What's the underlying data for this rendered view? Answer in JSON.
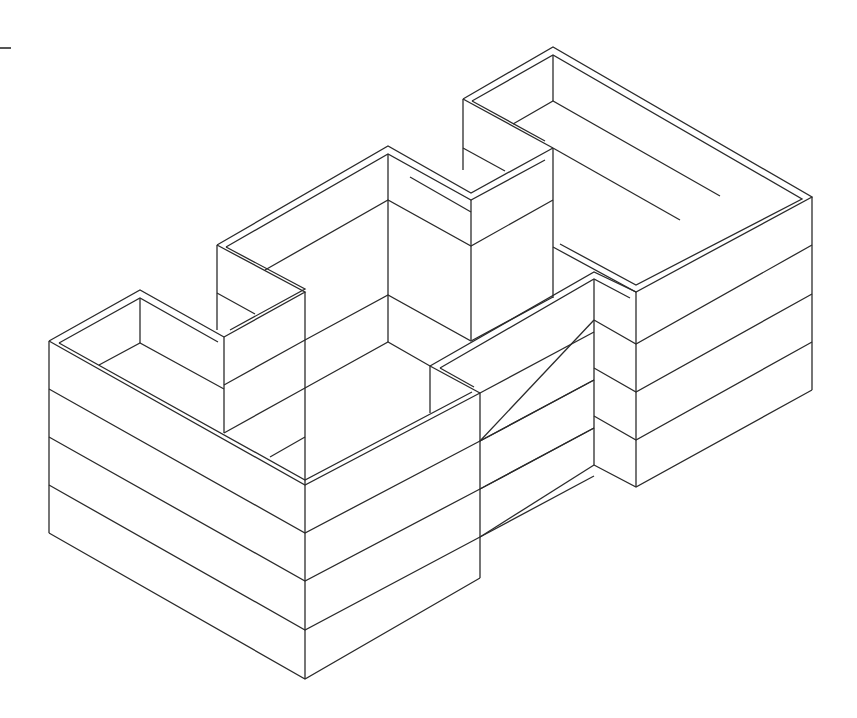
{
  "drawing": {
    "title": "",
    "stroke_color": "#2a2a2a",
    "stroke_width": 1.3,
    "background": "#ffffff",
    "marker": {
      "x1": 0,
      "y1": 48,
      "x2": 11,
      "y2": 48
    },
    "polylines": [
      {
        "part": "left-wing-rim-outer",
        "points": [
          [
            49,
            341
          ],
          [
            140,
            290
          ],
          [
            224,
            337
          ]
        ]
      },
      {
        "part": "left-wing-rim-inner",
        "points": [
          [
            59,
            343
          ],
          [
            140,
            298
          ],
          [
            218,
            342
          ]
        ]
      },
      {
        "part": "left-wing-front-rim-outer",
        "points": [
          [
            49,
            341
          ],
          [
            305,
            485
          ],
          [
            480,
            393
          ]
        ]
      },
      {
        "part": "left-wing-front-rim-inner",
        "points": [
          [
            59,
            343
          ],
          [
            305,
            480
          ],
          [
            472,
            392
          ]
        ]
      },
      {
        "part": "left-wing-left-edge",
        "points": [
          [
            49,
            341
          ],
          [
            49,
            533
          ]
        ]
      },
      {
        "part": "left-wing-level-1",
        "points": [
          [
            49,
            389
          ],
          [
            305,
            533
          ],
          [
            480,
            441
          ]
        ]
      },
      {
        "part": "left-wing-level-2",
        "points": [
          [
            49,
            437
          ],
          [
            305,
            581
          ],
          [
            480,
            489
          ]
        ]
      },
      {
        "part": "left-wing-level-3",
        "points": [
          [
            49,
            485
          ],
          [
            305,
            630
          ],
          [
            480,
            537
          ]
        ]
      },
      {
        "part": "left-wing-bottom",
        "points": [
          [
            49,
            533
          ],
          [
            305,
            679
          ],
          [
            480,
            578
          ]
        ]
      },
      {
        "part": "left-wing-front-edge",
        "points": [
          [
            305,
            485
          ],
          [
            305,
            679
          ]
        ]
      },
      {
        "part": "left-wing-right-edge",
        "points": [
          [
            480,
            393
          ],
          [
            480,
            578
          ]
        ]
      },
      {
        "part": "left-wing-inner-vertical",
        "points": [
          [
            140,
            298
          ],
          [
            140,
            343
          ]
        ]
      },
      {
        "part": "left-wing-inner-floor-a",
        "points": [
          [
            99,
            365
          ],
          [
            140,
            343
          ],
          [
            224,
            389
          ]
        ]
      },
      {
        "part": "left-wing-inner-wall",
        "points": [
          [
            224,
            337
          ],
          [
            224,
            433
          ]
        ]
      },
      {
        "part": "left-wing-inner-level",
        "points": [
          [
            224,
            385
          ],
          [
            305,
            340
          ]
        ]
      },
      {
        "part": "left-wing-inner-level-2",
        "points": [
          [
            224,
            433
          ],
          [
            305,
            388
          ]
        ]
      },
      {
        "part": "left-wing-inner-floor-b",
        "points": [
          [
            270,
            457
          ],
          [
            305,
            437
          ]
        ]
      },
      {
        "part": "mid-rim-outer",
        "points": [
          [
            217,
            245
          ],
          [
            388,
            146
          ],
          [
            471,
            193
          ],
          [
            553,
            148
          ]
        ]
      },
      {
        "part": "mid-rim-inner",
        "points": [
          [
            226,
            247
          ],
          [
            388,
            154
          ],
          [
            471,
            200
          ],
          [
            545,
            160
          ]
        ]
      },
      {
        "part": "mid-left-rim-outer",
        "points": [
          [
            217,
            245
          ],
          [
            305,
            292
          ],
          [
            224,
            337
          ]
        ]
      },
      {
        "part": "mid-left-rim-inner",
        "points": [
          [
            226,
            247
          ],
          [
            305,
            289
          ],
          [
            230,
            330
          ]
        ]
      },
      {
        "part": "mid-left-edge",
        "points": [
          [
            217,
            245
          ],
          [
            217,
            330
          ]
        ]
      },
      {
        "part": "mid-left-level",
        "points": [
          [
            217,
            293
          ],
          [
            255,
            314
          ]
        ]
      },
      {
        "part": "mid-front-edge",
        "points": [
          [
            305,
            292
          ],
          [
            305,
            485
          ]
        ]
      },
      {
        "part": "mid-back-vertical",
        "points": [
          [
            388,
            154
          ],
          [
            388,
            342
          ]
        ]
      },
      {
        "part": "mid-level-1",
        "points": [
          [
            265,
            270
          ],
          [
            388,
            200
          ],
          [
            471,
            246
          ],
          [
            553,
            200
          ]
        ]
      },
      {
        "part": "mid-level-2",
        "points": [
          [
            305,
            340
          ],
          [
            388,
            295
          ],
          [
            471,
            341
          ],
          [
            553,
            297
          ]
        ]
      },
      {
        "part": "mid-level-3",
        "points": [
          [
            305,
            388
          ],
          [
            388,
            342
          ],
          [
            430,
            366
          ]
        ]
      },
      {
        "part": "mid-inner-vertical",
        "points": [
          [
            471,
            200
          ],
          [
            471,
            340
          ]
        ]
      },
      {
        "part": "mid-inner-floor",
        "points": [
          [
            410,
            177
          ],
          [
            471,
            212
          ]
        ]
      },
      {
        "part": "right-rim-outer",
        "points": [
          [
            463,
            99
          ],
          [
            553,
            47
          ],
          [
            812,
            197
          ],
          [
            636,
            292
          ],
          [
            553,
            247
          ]
        ]
      },
      {
        "part": "right-rim-inner",
        "points": [
          [
            472,
            101
          ],
          [
            553,
            55
          ],
          [
            802,
            199
          ],
          [
            636,
            285
          ],
          [
            560,
            244
          ]
        ]
      },
      {
        "part": "right-left-rim-outer",
        "points": [
          [
            463,
            99
          ],
          [
            553,
            148
          ]
        ]
      },
      {
        "part": "right-left-rim-inner",
        "points": [
          [
            472,
            101
          ],
          [
            545,
            141
          ]
        ]
      },
      {
        "part": "right-left-edge",
        "points": [
          [
            463,
            99
          ],
          [
            463,
            170
          ]
        ]
      },
      {
        "part": "right-left-level",
        "points": [
          [
            463,
            148
          ],
          [
            505,
            171
          ]
        ]
      },
      {
        "part": "right-front-left-edge",
        "points": [
          [
            553,
            148
          ],
          [
            553,
            298
          ]
        ]
      },
      {
        "part": "right-back-vertical",
        "points": [
          [
            553,
            55
          ],
          [
            553,
            101
          ]
        ]
      },
      {
        "part": "right-floor-1",
        "points": [
          [
            513,
            124
          ],
          [
            553,
            101
          ],
          [
            720,
            196
          ]
        ]
      },
      {
        "part": "right-floor-2",
        "points": [
          [
            553,
            148
          ],
          [
            680,
            220
          ]
        ]
      },
      {
        "part": "right-corner-edge",
        "points": [
          [
            812,
            197
          ],
          [
            812,
            390
          ]
        ]
      },
      {
        "part": "right-front-corner-edge",
        "points": [
          [
            636,
            292
          ],
          [
            636,
            487
          ]
        ]
      },
      {
        "part": "right-level-1",
        "points": [
          [
            594,
            320
          ],
          [
            636,
            344
          ],
          [
            812,
            245
          ]
        ]
      },
      {
        "part": "right-level-2",
        "points": [
          [
            594,
            368
          ],
          [
            636,
            392
          ],
          [
            812,
            294
          ]
        ]
      },
      {
        "part": "right-level-3",
        "points": [
          [
            594,
            416
          ],
          [
            636,
            440
          ],
          [
            812,
            342
          ]
        ]
      },
      {
        "part": "right-bottom",
        "points": [
          [
            594,
            465
          ],
          [
            636,
            487
          ],
          [
            812,
            390
          ]
        ]
      },
      {
        "part": "front-block-rim-outer",
        "points": [
          [
            430,
            366
          ],
          [
            594,
            272
          ],
          [
            636,
            292
          ]
        ]
      },
      {
        "part": "front-block-rim-inner",
        "points": [
          [
            440,
            368
          ],
          [
            594,
            279
          ],
          [
            630,
            298
          ]
        ]
      },
      {
        "part": "front-block-left-rim-outer",
        "points": [
          [
            430,
            366
          ],
          [
            480,
            393
          ]
        ]
      },
      {
        "part": "front-block-left-rim-inner",
        "points": [
          [
            440,
            368
          ],
          [
            474,
            387
          ]
        ]
      },
      {
        "part": "front-block-left-edge",
        "points": [
          [
            430,
            366
          ],
          [
            430,
            413
          ]
        ]
      },
      {
        "part": "front-block-corner-edge",
        "points": [
          [
            594,
            279
          ],
          [
            594,
            465
          ]
        ]
      },
      {
        "part": "front-block-level-1",
        "points": [
          [
            480,
            441
          ],
          [
            594,
            320
          ]
        ]
      },
      {
        "part": "front-block-level-1b",
        "points": [
          [
            480,
            441
          ],
          [
            594,
            380
          ]
        ]
      },
      {
        "part": "front-block-level-2",
        "points": [
          [
            480,
            489
          ],
          [
            594,
            428
          ]
        ]
      },
      {
        "part": "front-block-level-3",
        "points": [
          [
            480,
            537
          ],
          [
            594,
            476
          ]
        ]
      },
      {
        "part": "front-block-top-line",
        "points": [
          [
            480,
            393
          ],
          [
            594,
            332
          ]
        ]
      },
      {
        "part": "front-block-mid-line",
        "points": [
          [
            480,
            441
          ],
          [
            594,
            380
          ]
        ]
      },
      {
        "part": "front-block-low-line",
        "points": [
          [
            480,
            489
          ],
          [
            594,
            428
          ]
        ]
      },
      {
        "part": "front-block-bottom-line",
        "points": [
          [
            480,
            537
          ],
          [
            594,
            465
          ]
        ]
      }
    ]
  }
}
